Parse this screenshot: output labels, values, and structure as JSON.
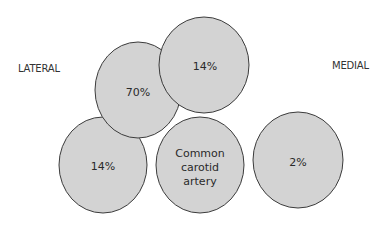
{
  "labels": {
    "left": "LATERAL",
    "right": "MEDIAL"
  },
  "circles": [
    {
      "id": "bottom-left",
      "text": [
        "14%"
      ]
    },
    {
      "id": "common-carotid",
      "text": [
        "Common",
        "carotid",
        "artery"
      ]
    },
    {
      "id": "upper-left",
      "text": [
        "70%"
      ]
    },
    {
      "id": "upper-right",
      "text": [
        "14%"
      ]
    },
    {
      "id": "right",
      "text": [
        "2%"
      ]
    }
  ],
  "colors": {
    "fill": "#d3d3d3",
    "stroke": "#3c3c3c",
    "text": "#2a2a2a"
  }
}
